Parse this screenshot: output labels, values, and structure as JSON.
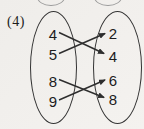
{
  "problem_label": "(4)",
  "diagram": {
    "type": "arrow-mapping-diagram",
    "domain": [
      "4",
      "5",
      "8",
      "9"
    ],
    "codomain": [
      "2",
      "4",
      "6",
      "8"
    ],
    "mappings": [
      {
        "from": "4",
        "to": "4"
      },
      {
        "from": "5",
        "to": "2"
      },
      {
        "from": "8",
        "to": "8"
      },
      {
        "from": "9",
        "to": "6"
      }
    ]
  },
  "colors": {
    "background": "#f1efec",
    "stroke": "#2e2e2e",
    "text": "#1c1c1c",
    "remnant_stroke": "#9a9a9a"
  }
}
